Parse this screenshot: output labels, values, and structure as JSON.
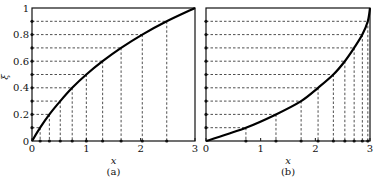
{
  "chart_data": [
    {
      "type": "line",
      "panel_label": "(a)",
      "xlabel": "x",
      "ylabel": "ξ",
      "xlim": [
        0,
        3
      ],
      "ylim": [
        0,
        1
      ],
      "x_ticks": [
        "0",
        "1",
        "2",
        "3"
      ],
      "y_ticks": [
        "0",
        "0.2",
        "0.4",
        "0.6",
        "0.8",
        "1"
      ],
      "curve": "concave increasing from (0,0) to (3,1)",
      "levels": [
        0.1,
        0.2,
        0.3,
        0.4,
        0.5,
        0.6,
        0.7,
        0.8,
        0.9
      ],
      "x_at_levels": [
        0.15,
        0.32,
        0.52,
        0.74,
        1.0,
        1.3,
        1.64,
        2.03,
        2.48
      ],
      "grid": "dashed projection lines"
    },
    {
      "type": "line",
      "panel_label": "(b)",
      "xlabel": "x",
      "ylabel": "",
      "xlim": [
        0,
        3
      ],
      "ylim": [
        0,
        1
      ],
      "x_ticks": [
        "0",
        "1",
        "2",
        "3"
      ],
      "curve": "convex increasing from (0,0) to (3,1)",
      "levels": [
        0.1,
        0.2,
        0.3,
        0.4,
        0.5,
        0.6,
        0.7,
        0.8,
        0.9
      ],
      "x_at_levels": [
        0.73,
        1.28,
        1.74,
        2.05,
        2.33,
        2.54,
        2.71,
        2.86,
        2.96
      ],
      "grid": "dashed projection lines"
    }
  ],
  "labels": {
    "a_panel": "(a)",
    "b_panel": "(b)",
    "xlabel": "x",
    "ylabel": "ξ",
    "yticks": [
      "0",
      "0.2",
      "0.4",
      "0.6",
      "0.8",
      "1"
    ],
    "xticks": [
      "0",
      "1",
      "2",
      "3"
    ]
  }
}
